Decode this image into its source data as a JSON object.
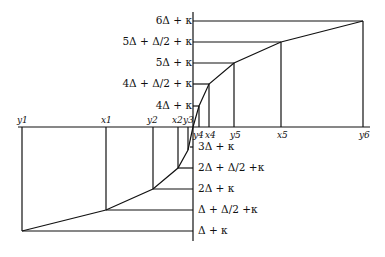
{
  "diagram": {
    "upper_labels": [
      {
        "text": "6Δ + κ",
        "y": 21
      },
      {
        "text": "5Δ + Δ/2 + κ",
        "y": 42
      },
      {
        "text": "5Δ + κ",
        "y": 63
      },
      {
        "text": "4Δ + Δ/2 + κ",
        "y": 84
      },
      {
        "text": "4Δ + κ",
        "y": 106
      }
    ],
    "lower_labels": [
      {
        "text": "3Δ + κ",
        "y": 147
      },
      {
        "text": "2Δ + Δ/2 +κ",
        "y": 168
      },
      {
        "text": "2Δ + κ",
        "y": 189
      },
      {
        "text": "Δ + Δ/2 +κ",
        "y": 210
      },
      {
        "text": "Δ + κ",
        "y": 231
      }
    ],
    "axis_top_labels": [
      "y1",
      "x1",
      "y2",
      "x2",
      "y3"
    ],
    "axis_bottom_labels": [
      "y4",
      "x4",
      "y5",
      "x5",
      "y6"
    ]
  }
}
